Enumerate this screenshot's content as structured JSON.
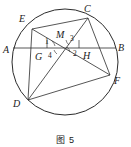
{
  "figure": {
    "caption": "图 5",
    "stroke_color": "#2b2b2b",
    "background_color": "#ffffff",
    "text_color": "#1a1a1a"
  },
  "circle": {
    "cx": 65,
    "cy": 62,
    "r": 53
  },
  "points": {
    "A": {
      "label": "A",
      "x": 10,
      "y": 50
    },
    "B": {
      "label": "B",
      "x": 116,
      "y": 50
    },
    "C": {
      "label": "C",
      "x": 88,
      "y": 14
    },
    "D": {
      "label": "D",
      "x": 26,
      "y": 101
    },
    "E": {
      "label": "E",
      "x": 27,
      "y": 25
    },
    "F": {
      "label": "F",
      "x": 112,
      "y": 78
    },
    "G": {
      "label": "G",
      "x": 43,
      "y": 50
    },
    "H": {
      "label": "H",
      "x": 85,
      "y": 50
    },
    "M": {
      "label": "M",
      "x": 62,
      "y": 48
    }
  },
  "vertex_labels": [
    {
      "name": "label-A",
      "text": "A",
      "x": 3,
      "y": 45
    },
    {
      "name": "label-B",
      "text": "B",
      "x": 118,
      "y": 43
    },
    {
      "name": "label-C",
      "text": "C",
      "x": 84,
      "y": 4
    },
    {
      "name": "label-D",
      "text": "D",
      "x": 13,
      "y": 99
    },
    {
      "name": "label-E",
      "text": "E",
      "x": 19,
      "y": 14
    },
    {
      "name": "label-F",
      "text": "F",
      "x": 114,
      "y": 76
    },
    {
      "name": "label-G",
      "text": "G",
      "x": 35,
      "y": 52
    },
    {
      "name": "label-H",
      "text": "H",
      "x": 83,
      "y": 51
    },
    {
      "name": "label-M",
      "text": "M",
      "x": 56,
      "y": 30
    }
  ],
  "angle_labels": [
    {
      "name": "angle-1",
      "text": "1",
      "x": 45,
      "y": 38
    },
    {
      "name": "angle-2",
      "text": "2",
      "x": 73,
      "y": 50
    },
    {
      "name": "angle-3",
      "text": "3",
      "x": 70,
      "y": 35
    },
    {
      "name": "angle-4",
      "text": "4",
      "x": 48,
      "y": 52
    }
  ],
  "segments": [
    {
      "name": "chord-AB",
      "x1": 13,
      "y1": 48,
      "x2": 116,
      "y2": 48
    },
    {
      "name": "chord-CD",
      "x1": 88,
      "y1": 18,
      "x2": 28,
      "y2": 100
    },
    {
      "name": "chord-EF",
      "x1": 32,
      "y1": 29,
      "x2": 110,
      "y2": 75
    },
    {
      "name": "chord-ED",
      "x1": 32,
      "y1": 29,
      "x2": 28,
      "y2": 100
    },
    {
      "name": "chord-CF",
      "x1": 88,
      "y1": 18,
      "x2": 110,
      "y2": 75
    },
    {
      "name": "chord-EC",
      "x1": 32,
      "y1": 29,
      "x2": 88,
      "y2": 18
    },
    {
      "name": "chord-DF",
      "x1": 28,
      "y1": 100,
      "x2": 110,
      "y2": 75
    }
  ],
  "angle_arcs": [
    {
      "name": "arc-angle-1",
      "d": "M 52 41 A 10 10 0 0 1 55 46"
    },
    {
      "name": "arc-angle-2",
      "d": "M 70 52 A 9 9 0 0 0 67 47"
    },
    {
      "name": "arc-angle-3",
      "d": "M 66 40 A 9 9 0 0 0 69 45"
    },
    {
      "name": "arc-angle-4",
      "d": "M 54 50 A 9 9 0 0 0 57 54"
    }
  ],
  "tick_marks": [
    {
      "name": "tick-left-chord",
      "x1": 47,
      "y1": 40,
      "x2": 47,
      "y2": 48
    },
    {
      "name": "tick-right-chord",
      "x1": 79,
      "y1": 40,
      "x2": 79,
      "y2": 48
    }
  ]
}
